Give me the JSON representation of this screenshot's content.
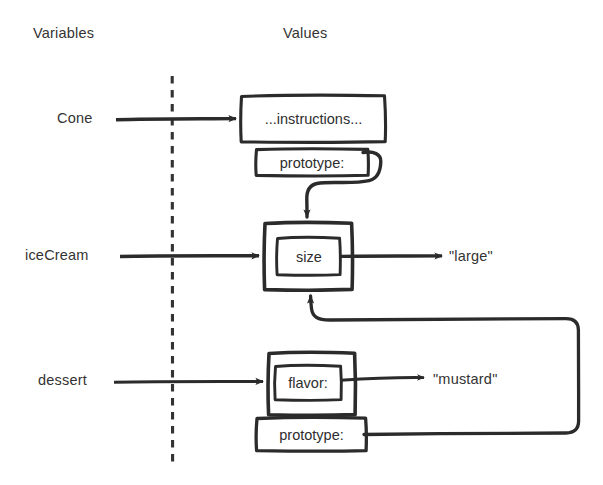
{
  "diagram": {
    "title_columns": {
      "variables": "Variables",
      "values": "Values"
    },
    "divider": {
      "name": "variables-values-divider",
      "style": "dashed-vertical"
    },
    "ink_color": "#2b2b2b",
    "background_color": "#ffffff",
    "variables": [
      {
        "name": "Cone",
        "id": "cone"
      },
      {
        "name": "iceCream",
        "id": "icecream"
      },
      {
        "name": "dessert",
        "id": "dessert"
      }
    ],
    "objects": [
      {
        "id": "cone-object",
        "owner": "Cone",
        "slots": [
          {
            "key": "...instructions...",
            "id": "instructions-slot"
          },
          {
            "key": "prototype:",
            "id": "cone-prototype-slot"
          }
        ]
      },
      {
        "id": "icecream-object",
        "owner": "iceCream",
        "slots": [
          {
            "key": "size",
            "id": "size-slot"
          }
        ]
      },
      {
        "id": "dessert-object",
        "owner": "dessert",
        "slots": [
          {
            "key": "flavor:",
            "id": "flavor-slot"
          },
          {
            "key": "prototype:",
            "id": "dessert-prototype-slot"
          }
        ]
      }
    ],
    "values": [
      {
        "id": "size-value",
        "text": "\"large\"",
        "from": "size-slot"
      },
      {
        "id": "flavor-value",
        "text": "\"mustard\"",
        "from": "flavor-slot"
      }
    ],
    "links": [
      {
        "id": "cone-to-object",
        "from": "Cone",
        "to": "cone-object",
        "arrow": true
      },
      {
        "id": "icecream-to-object",
        "from": "iceCream",
        "to": "icecream-object",
        "arrow": true
      },
      {
        "id": "dessert-to-object",
        "from": "dessert",
        "to": "dessert-object",
        "arrow": true
      },
      {
        "id": "cone-proto-to-icecream",
        "from": "cone-prototype-slot",
        "to": "icecream-object",
        "arrow": true
      },
      {
        "id": "dessert-proto-to-icecream",
        "from": "dessert-prototype-slot",
        "to": "icecream-object",
        "arrow": true
      },
      {
        "id": "size-to-large",
        "from": "size-slot",
        "to": "size-value",
        "arrow": true
      },
      {
        "id": "flavor-to-mustard",
        "from": "flavor-slot",
        "to": "flavor-value",
        "arrow": true
      }
    ]
  }
}
